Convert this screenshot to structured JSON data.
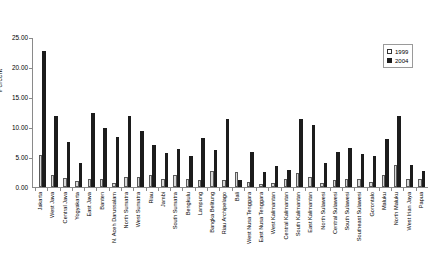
{
  "chart_data": {
    "type": "bar",
    "title": "",
    "xlabel": "",
    "ylabel": "Percent",
    "ylim": [
      0,
      25
    ],
    "grid": false,
    "legend_position": "top-right",
    "ytick_labels": [
      "25.00",
      "20.00",
      "15.00",
      "10.00",
      "5.00",
      "0.00"
    ],
    "ytick_values": [
      25,
      20,
      15,
      10,
      5,
      0
    ],
    "categories": [
      "Jakarta",
      "West Java",
      "Central Java",
      "Yogyakarta",
      "East Java",
      "Banten",
      "N. Aceh Darussalam",
      "North Sumatra",
      "West Sumatra",
      "Riau",
      "Jambi",
      "South Sumatra",
      "Bengkulu",
      "Lampung",
      "Bangka Belitung",
      "Riau Archipelago",
      "Bali",
      "West Nusa Tenggara",
      "East Nusa Tenggara",
      "West Kalimantan",
      "Central Kalimantan",
      "South Kalimantan",
      "East Kalimantan",
      "North Sulawesi",
      "Central Sulawesi",
      "South Sulawesi",
      "Southeast Sulawesi",
      "Gorontalo",
      "Maluku",
      "North Maluku",
      "West Irian Jaya",
      "Papua"
    ],
    "series": [
      {
        "name": "1999",
        "color": "#d9d9d9",
        "values": [
          5.3,
          2.0,
          1.5,
          1.0,
          1.3,
          1.4,
          0.6,
          1.7,
          1.7,
          2.0,
          1.4,
          2.0,
          1.3,
          1.2,
          2.6,
          1.1,
          2.5,
          0.9,
          0.5,
          0.7,
          1.3,
          2.3,
          1.6,
          0.7,
          1.1,
          1.3,
          1.3,
          0.9,
          2.0,
          3.6,
          1.3,
          1.3
        ]
      },
      {
        "name": "2004",
        "color": "#1c1c1c",
        "values": [
          22.7,
          11.9,
          7.5,
          4.0,
          12.3,
          9.9,
          8.3,
          11.8,
          9.3,
          7.0,
          5.7,
          6.4,
          5.2,
          8.2,
          6.1,
          11.3,
          1.1,
          5.8,
          2.5,
          3.5,
          2.8,
          11.4,
          10.3,
          4.0,
          5.8,
          6.5,
          5.5,
          5.1,
          8.0,
          11.9,
          3.7,
          2.6
        ]
      }
    ]
  },
  "legend": {
    "entries": [
      {
        "label": "1999",
        "swatch": "open-square"
      },
      {
        "label": "2004",
        "swatch": "filled-square"
      }
    ]
  }
}
